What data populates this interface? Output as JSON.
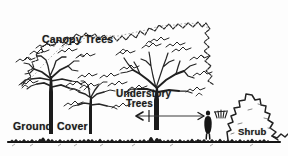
{
  "figure": {
    "title_alt": "Forest vertical structure diagram",
    "background_color": "#fdfdfd",
    "ink_color": "#1b1b1b",
    "width": 288,
    "height": 156,
    "style": "black-and-white scanned line drawing"
  },
  "labels": {
    "canopy_trees": "Canopy Trees",
    "understory_line1": "Understory",
    "understory_line2": "Trees",
    "ground": "Ground",
    "cover": "Cover",
    "shrub": "Shrub"
  },
  "elements": {
    "canopy_outline": "canopy-outline",
    "left_canopy_tree": "left-canopy-tree",
    "right_canopy_tree": "right-canopy-tree",
    "small_understory_tree": "small-understory-tree",
    "understory_tree": "understory-tree",
    "shrub_shape": "shrub-shape",
    "human_figure": "human-figure-for-scale",
    "ground_line": "ground-line",
    "scale_arrow": "double-headed-scale-arrow"
  }
}
